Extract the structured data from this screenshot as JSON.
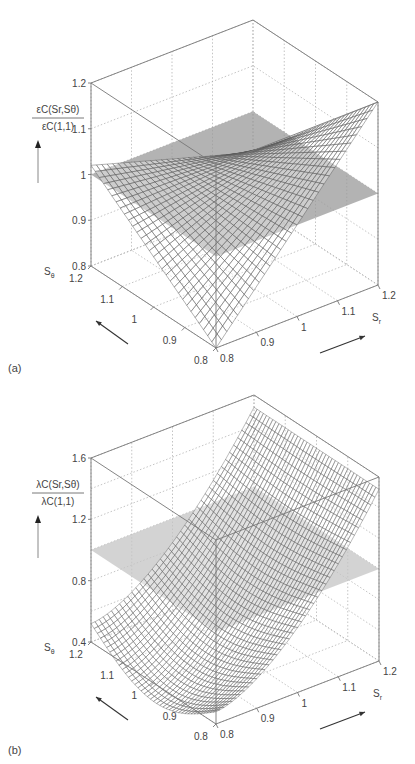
{
  "chart_data": [
    {
      "id": "a",
      "panel_label": "(a)",
      "type": "surface3d",
      "title": "",
      "zlabel": {
        "numerator": "εC(Sr,Sθ)",
        "denominator": "εC(1,1)"
      },
      "xlabel": "Sr",
      "ylabel": "Sθ",
      "x_ticks": [
        "0.8",
        "0.9",
        "1",
        "1.1",
        "1.2"
      ],
      "y_ticks": [
        "0.8",
        "0.9",
        "1",
        "1.1",
        "1.2"
      ],
      "z_ticks": [
        "0.8",
        "0.9",
        "1",
        "1.1",
        "1.2"
      ],
      "xlim": [
        0.8,
        1.2
      ],
      "ylim": [
        0.8,
        1.2
      ],
      "zlim": [
        0.8,
        1.2
      ],
      "grid": true,
      "surface": {
        "description": "Planar mesh surface, z increases with Sr and decreases with Sθ",
        "corners": [
          {
            "Sr": 0.8,
            "Stheta": 0.8,
            "z": 0.8
          },
          {
            "Sr": 1.2,
            "Stheta": 0.8,
            "z": 1.2
          },
          {
            "Sr": 0.8,
            "Stheta": 1.2,
            "z": 1.02
          },
          {
            "Sr": 1.2,
            "Stheta": 1.2,
            "z": 0.91
          }
        ],
        "mesh_n": 30
      },
      "reference_plane": {
        "z": 1.0,
        "color": "#9a9a9a"
      }
    },
    {
      "id": "b",
      "panel_label": "(b)",
      "type": "surface3d",
      "title": "",
      "zlabel": {
        "numerator": "λC(Sr,Sθ)",
        "denominator": "λC(1,1)"
      },
      "xlabel": "Sr",
      "ylabel": "Sθ",
      "x_ticks": [
        "0.8",
        "0.9",
        "1",
        "1.1",
        "1.2"
      ],
      "y_ticks": [
        "0.8",
        "0.9",
        "1",
        "1.1",
        "1.2"
      ],
      "z_ticks": [
        "0.4",
        "0.8",
        "1.2",
        "1.6"
      ],
      "xlim": [
        0.8,
        1.2
      ],
      "ylim": [
        0.8,
        1.2
      ],
      "zlim": [
        0.4,
        1.6
      ],
      "grid": true,
      "surface": {
        "description": "Curved mesh surface rising strongly with Sr, curved along Sθ; min ~0.45 at Sr=0.8, max ~1.52 at Sr=1.2",
        "corners": [
          {
            "Sr": 0.8,
            "Stheta": 0.8,
            "z": 0.48
          },
          {
            "Sr": 1.2,
            "Stheta": 0.8,
            "z": 1.52
          },
          {
            "Sr": 0.8,
            "Stheta": 1.2,
            "z": 0.52
          },
          {
            "Sr": 1.2,
            "Stheta": 1.2,
            "z": 1.52
          }
        ],
        "mesh_n": 40
      },
      "reference_plane": {
        "z": 1.0,
        "color": "#c4c4c4"
      }
    }
  ]
}
